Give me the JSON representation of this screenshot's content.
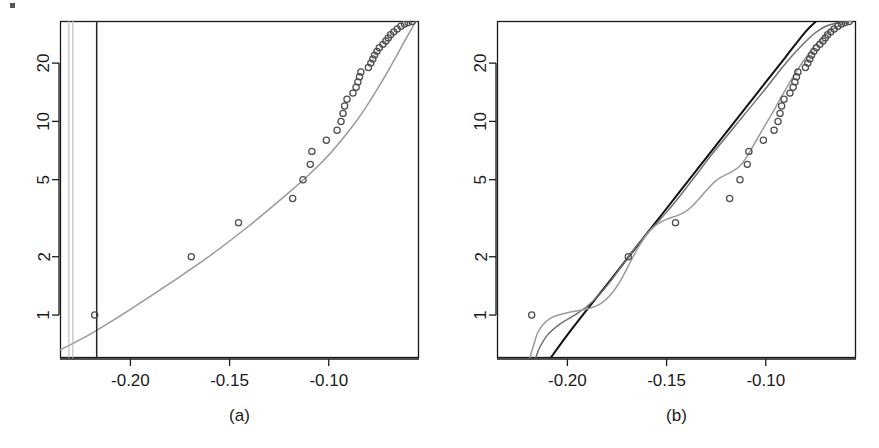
{
  "figure": {
    "type": "two-panel-statistical-figure",
    "background_color": "#ffffff",
    "width": 879,
    "height": 448
  },
  "panels": [
    {
      "id": "a",
      "caption": "(a)",
      "box": {
        "left": 60,
        "top": 21,
        "right": 419,
        "bottom": 358
      }
    },
    {
      "id": "b",
      "caption": "(b)",
      "box": {
        "left": 497,
        "top": 21,
        "right": 856,
        "bottom": 358
      }
    }
  ],
  "colors": {
    "axis": "#1a1a1a",
    "point_stroke": "#4d4d4d",
    "curve_gray": "#9a9a9a",
    "curve_mid_gray": "#6f6f6f",
    "curve_black": "#111111",
    "vline_light": "#b8b8b8",
    "vline_dark": "#262626",
    "text": "#1a1a1a"
  },
  "chart_data": [
    {
      "type": "scatter",
      "panel": "a",
      "title": "",
      "subtitle": "",
      "xlabel": "",
      "ylabel": "",
      "caption": "(a)",
      "grid": false,
      "legend": "none",
      "xscale": "linear",
      "yscale": "log",
      "xlim": [
        -0.2355,
        -0.0545
      ],
      "ylim": [
        0.6,
        33.0
      ],
      "xticks": [
        -0.2,
        -0.15,
        -0.1
      ],
      "xtick_labels": [
        "-0.20",
        "-0.15",
        "-0.10"
      ],
      "yticks": [
        1,
        2,
        5,
        10,
        20
      ],
      "ytick_labels": [
        "1",
        "2",
        "5",
        "10",
        "20"
      ],
      "series": [
        {
          "name": "observed-points",
          "kind": "scatter",
          "marker": "open-circle",
          "color": "#4d4d4d",
          "points": [
            [
              -0.218,
              1.0
            ],
            [
              -0.1693,
              2.0
            ],
            [
              -0.1455,
              3.0
            ],
            [
              -0.1182,
              4.0
            ],
            [
              -0.113,
              5.0
            ],
            [
              -0.1093,
              6.0
            ],
            [
              -0.1085,
              7.0
            ],
            [
              -0.1012,
              8.0
            ],
            [
              -0.0958,
              9.0
            ],
            [
              -0.0938,
              10.0
            ],
            [
              -0.0928,
              11.0
            ],
            [
              -0.092,
              12.0
            ],
            [
              -0.0908,
              13.0
            ],
            [
              -0.0878,
              14.0
            ],
            [
              -0.0862,
              15.0
            ],
            [
              -0.0853,
              16.0
            ],
            [
              -0.0845,
              17.0
            ],
            [
              -0.0838,
              18.0
            ],
            [
              -0.08,
              19.0
            ],
            [
              -0.0788,
              20.0
            ],
            [
              -0.0778,
              21.0
            ],
            [
              -0.0769,
              22.0
            ],
            [
              -0.0757,
              23.0
            ],
            [
              -0.0745,
              24.0
            ],
            [
              -0.0727,
              25.0
            ],
            [
              -0.0712,
              26.0
            ],
            [
              -0.07,
              27.0
            ],
            [
              -0.0688,
              28.0
            ],
            [
              -0.0672,
              29.0
            ],
            [
              -0.0655,
              30.0
            ],
            [
              -0.0636,
              31.0
            ],
            [
              -0.0618,
              31.8
            ],
            [
              -0.06,
              32.4
            ],
            [
              -0.058,
              32.8
            ]
          ]
        },
        {
          "name": "fitted-curve",
          "kind": "line",
          "color": "#9a9a9a",
          "points": [
            [
              -0.2355,
              0.66
            ],
            [
              -0.22,
              0.8
            ],
            [
              -0.2,
              1.07
            ],
            [
              -0.18,
              1.46
            ],
            [
              -0.16,
              2.02
            ],
            [
              -0.14,
              2.9
            ],
            [
              -0.12,
              4.3
            ],
            [
              -0.11,
              5.3
            ],
            [
              -0.1,
              6.7
            ],
            [
              -0.09,
              8.9
            ],
            [
              -0.085,
              10.4
            ],
            [
              -0.08,
              12.4
            ],
            [
              -0.075,
              15.0
            ],
            [
              -0.07,
              18.3
            ],
            [
              -0.065,
              22.6
            ],
            [
              -0.06,
              28.0
            ],
            [
              -0.056,
              33.0
            ]
          ]
        },
        {
          "name": "vertical-reference-line-light-1",
          "kind": "vline",
          "color": "#b8b8b8",
          "x": -0.231
        },
        {
          "name": "vertical-reference-line-light-2",
          "kind": "vline",
          "color": "#b8b8b8",
          "x": -0.229
        },
        {
          "name": "vertical-reference-line-dark",
          "kind": "vline",
          "color": "#262626",
          "x": -0.217
        }
      ]
    },
    {
      "type": "scatter",
      "panel": "b",
      "title": "",
      "subtitle": "",
      "xlabel": "",
      "ylabel": "",
      "caption": "(b)",
      "grid": false,
      "legend": "none",
      "xscale": "linear",
      "yscale": "log",
      "xlim": [
        -0.2355,
        -0.0545
      ],
      "ylim": [
        0.6,
        33.0
      ],
      "xticks": [
        -0.2,
        -0.15,
        -0.1
      ],
      "xtick_labels": [
        "-0.20",
        "-0.15",
        "-0.10"
      ],
      "yticks": [
        1,
        2,
        5,
        10,
        20
      ],
      "ytick_labels": [
        "1",
        "2",
        "5",
        "10",
        "20"
      ],
      "series": [
        {
          "name": "observed-points",
          "kind": "scatter",
          "marker": "open-circle",
          "color": "#4d4d4d",
          "points": [
            [
              -0.218,
              1.0
            ],
            [
              -0.1693,
              2.0
            ],
            [
              -0.1455,
              3.0
            ],
            [
              -0.1182,
              4.0
            ],
            [
              -0.113,
              5.0
            ],
            [
              -0.1093,
              6.0
            ],
            [
              -0.1085,
              7.0
            ],
            [
              -0.1012,
              8.0
            ],
            [
              -0.0958,
              9.0
            ],
            [
              -0.0938,
              10.0
            ],
            [
              -0.0928,
              11.0
            ],
            [
              -0.092,
              12.0
            ],
            [
              -0.0908,
              13.0
            ],
            [
              -0.0878,
              14.0
            ],
            [
              -0.0862,
              15.0
            ],
            [
              -0.0853,
              16.0
            ],
            [
              -0.0845,
              17.0
            ],
            [
              -0.0838,
              18.0
            ],
            [
              -0.08,
              19.0
            ],
            [
              -0.0788,
              20.0
            ],
            [
              -0.0778,
              21.0
            ],
            [
              -0.0769,
              22.0
            ],
            [
              -0.0757,
              23.0
            ],
            [
              -0.0745,
              24.0
            ],
            [
              -0.0727,
              25.0
            ],
            [
              -0.0712,
              26.0
            ],
            [
              -0.07,
              27.0
            ],
            [
              -0.0688,
              28.0
            ],
            [
              -0.0672,
              29.0
            ],
            [
              -0.0655,
              30.0
            ],
            [
              -0.0636,
              31.0
            ],
            [
              -0.0618,
              31.8
            ],
            [
              -0.06,
              32.4
            ],
            [
              -0.058,
              32.8
            ]
          ]
        },
        {
          "name": "fitted-line-black",
          "kind": "line",
          "color": "#111111",
          "points": [
            [
              -0.2085,
              0.6
            ],
            [
              -0.2,
              0.79
            ],
            [
              -0.19,
              1.07
            ],
            [
              -0.18,
              1.44
            ],
            [
              -0.17,
              1.95
            ],
            [
              -0.16,
              2.63
            ],
            [
              -0.15,
              3.55
            ],
            [
              -0.14,
              4.8
            ],
            [
              -0.13,
              6.48
            ],
            [
              -0.12,
              8.75
            ],
            [
              -0.11,
              11.8
            ],
            [
              -0.1,
              15.95
            ],
            [
              -0.09,
              21.5
            ],
            [
              -0.08,
              29.0
            ],
            [
              -0.0745,
              33.0
            ]
          ]
        },
        {
          "name": "fitted-curve-mid-gray",
          "kind": "line",
          "color": "#6f6f6f",
          "points": [
            [
              -0.216,
              0.6
            ],
            [
              -0.214,
              0.68
            ],
            [
              -0.21,
              0.79
            ],
            [
              -0.205,
              0.88
            ],
            [
              -0.2,
              0.95
            ],
            [
              -0.195,
              1.02
            ],
            [
              -0.19,
              1.11
            ],
            [
              -0.185,
              1.24
            ],
            [
              -0.18,
              1.42
            ],
            [
              -0.175,
              1.66
            ],
            [
              -0.17,
              1.95
            ],
            [
              -0.165,
              2.28
            ],
            [
              -0.16,
              2.62
            ],
            [
              -0.155,
              2.98
            ],
            [
              -0.15,
              3.4
            ],
            [
              -0.145,
              3.92
            ],
            [
              -0.14,
              4.55
            ],
            [
              -0.135,
              5.3
            ],
            [
              -0.13,
              6.2
            ],
            [
              -0.125,
              7.2
            ],
            [
              -0.12,
              8.3
            ],
            [
              -0.115,
              9.6
            ],
            [
              -0.11,
              11.1
            ],
            [
              -0.105,
              12.8
            ],
            [
              -0.1,
              14.8
            ],
            [
              -0.095,
              17.2
            ],
            [
              -0.09,
              19.9
            ],
            [
              -0.085,
              22.8
            ],
            [
              -0.08,
              25.8
            ],
            [
              -0.075,
              28.7
            ],
            [
              -0.07,
              30.9
            ],
            [
              -0.065,
              32.1
            ],
            [
              -0.06,
              32.8
            ],
            [
              -0.057,
              33.0
            ]
          ]
        },
        {
          "name": "fitted-curve-light-gray",
          "kind": "line",
          "color": "#9a9a9a",
          "points": [
            [
              -0.219,
              0.6
            ],
            [
              -0.217,
              0.7
            ],
            [
              -0.215,
              0.81
            ],
            [
              -0.212,
              0.9
            ],
            [
              -0.208,
              0.97
            ],
            [
              -0.203,
              1.01
            ],
            [
              -0.198,
              1.04
            ],
            [
              -0.193,
              1.06
            ],
            [
              -0.188,
              1.09
            ],
            [
              -0.183,
              1.15
            ],
            [
              -0.178,
              1.28
            ],
            [
              -0.173,
              1.52
            ],
            [
              -0.169,
              1.82
            ],
            [
              -0.165,
              2.17
            ],
            [
              -0.161,
              2.52
            ],
            [
              -0.157,
              2.82
            ],
            [
              -0.153,
              3.02
            ],
            [
              -0.149,
              3.15
            ],
            [
              -0.145,
              3.25
            ],
            [
              -0.141,
              3.4
            ],
            [
              -0.137,
              3.66
            ],
            [
              -0.133,
              4.05
            ],
            [
              -0.129,
              4.52
            ],
            [
              -0.125,
              4.95
            ],
            [
              -0.121,
              5.25
            ],
            [
              -0.117,
              5.5
            ],
            [
              -0.113,
              5.9
            ],
            [
              -0.109,
              6.7
            ],
            [
              -0.105,
              7.9
            ],
            [
              -0.101,
              9.3
            ],
            [
              -0.097,
              10.9
            ],
            [
              -0.093,
              12.9
            ],
            [
              -0.089,
              15.2
            ],
            [
              -0.085,
              17.8
            ],
            [
              -0.081,
              20.5
            ],
            [
              -0.077,
              23.4
            ],
            [
              -0.073,
              26.2
            ],
            [
              -0.069,
              28.7
            ],
            [
              -0.065,
              30.6
            ],
            [
              -0.061,
              32.0
            ],
            [
              -0.057,
              33.0
            ]
          ]
        }
      ]
    }
  ],
  "artifact": {
    "name": "scan-speck",
    "x": 10,
    "y": 3,
    "width": 5,
    "height": 5,
    "color": "#3a3a3a"
  }
}
